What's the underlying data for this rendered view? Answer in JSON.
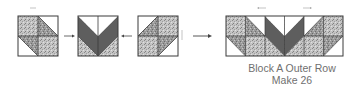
{
  "diagram": {
    "type": "quilt-block-assembly",
    "colors": {
      "outline": "#3a3a3a",
      "dark_fabric": "#5e5e5e",
      "speckled_fabric": "#bdbdbd",
      "light_fabric": "#ffffff",
      "arrow": "#444444",
      "press_arrow": "#9a9a9a",
      "caption_text": "#6f6f6f"
    },
    "units": [
      {
        "name": "left-half-square-triangle-unit",
        "position": 1
      },
      {
        "name": "center-flying-geese-v-unit",
        "position": 2
      },
      {
        "name": "right-half-square-triangle-unit",
        "position": 3
      }
    ],
    "result": {
      "name": "block-a-outer-row"
    },
    "caption": {
      "line1": "Block A Outer Row",
      "line2": "Make 26"
    }
  }
}
